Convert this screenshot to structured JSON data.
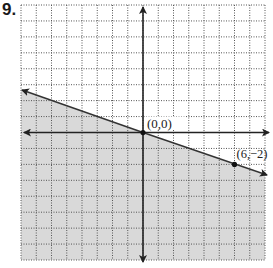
{
  "problem_number": "9.",
  "chart_data": {
    "type": "line",
    "title": "",
    "xlabel": "",
    "ylabel": "",
    "xlim": [
      -8,
      8
    ],
    "ylim": [
      -8,
      8
    ],
    "grid": true,
    "line": {
      "equation": "y = -x/3",
      "slope": -0.3333,
      "intercept": 0,
      "style": "solid"
    },
    "points": [
      {
        "x": 0,
        "y": 0,
        "label": "(0,0)"
      },
      {
        "x": 6,
        "y": -2,
        "label": "(6,−2)"
      }
    ],
    "shaded_region": "below line",
    "colors": {
      "shade": "#d9d9d9",
      "axis": "#222222",
      "grid": "#555555"
    }
  }
}
